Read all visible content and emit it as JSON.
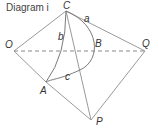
{
  "title": "Diagram i",
  "points": {
    "C": {
      "label": "C",
      "x": 66,
      "y": 11
    },
    "O": {
      "label": "O",
      "x": 14,
      "y": 51
    },
    "Q": {
      "label": "Q",
      "x": 145,
      "y": 51
    },
    "A": {
      "label": "A",
      "x": 46,
      "y": 82
    },
    "P": {
      "label": "P",
      "x": 91,
      "y": 120
    },
    "B": {
      "label": "B",
      "x": 93,
      "y": 51
    }
  },
  "arc_labels": {
    "a": "a",
    "b": "b",
    "c": "c"
  },
  "colors": {
    "line": "#9a9a9a",
    "curve": "#7a7a7a",
    "text": "#333333"
  }
}
